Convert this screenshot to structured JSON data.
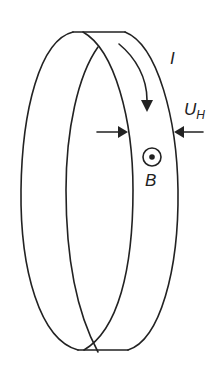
{
  "diagram": {
    "labels": {
      "current": "I",
      "hall_voltage_main": "U",
      "hall_voltage_sub": "H",
      "magnetic_field": "B"
    },
    "colors": {
      "stroke": "#222222",
      "background": "#ffffff"
    }
  }
}
